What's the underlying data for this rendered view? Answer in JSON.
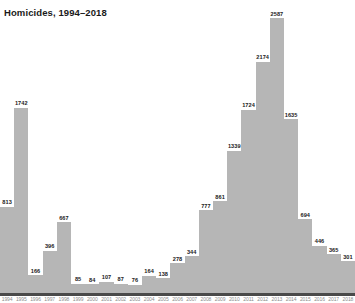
{
  "chart": {
    "title": "Homicides, 1994–2018"
  },
  "chart_data": {
    "type": "bar",
    "title": "Homicides, 1994–2018",
    "xlabel": "",
    "ylabel": "",
    "ylim": [
      0,
      2587
    ],
    "grid": false,
    "legend": null,
    "bar_color": "#b6b6b6",
    "axis_color": "#4a4a4a",
    "label_color": "#1a1a1a",
    "categories": [
      "1994",
      "1995",
      "1996",
      "1997",
      "1998",
      "1999",
      "2000",
      "2001",
      "2002",
      "2003",
      "2004",
      "2005",
      "2006",
      "2007",
      "2008",
      "2009",
      "2010",
      "2011",
      "2012",
      "2013",
      "2014",
      "2015",
      "2016",
      "2017",
      "2018"
    ],
    "values": [
      813,
      1742,
      166,
      396,
      667,
      85,
      84,
      107,
      87,
      76,
      164,
      138,
      278,
      344,
      777,
      861,
      1339,
      1724,
      2174,
      2587,
      1635,
      694,
      446,
      365,
      301
    ],
    "value_labels": [
      "813",
      "1742",
      "166",
      "396",
      "667",
      "85",
      "84",
      "107",
      "87",
      "76",
      "164",
      "138",
      "278",
      "344",
      "777",
      "861",
      "1339",
      "1724",
      "2174",
      "2587",
      "1635",
      "694",
      "446",
      "365",
      "301"
    ]
  }
}
